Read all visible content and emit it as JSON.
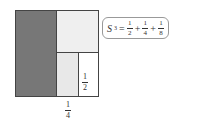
{
  "diagram": {
    "colors": {
      "dark": "#777777",
      "light": "#efefef",
      "border": "#444444"
    },
    "labels": {
      "inner_half": {
        "num": "1",
        "den": "2"
      },
      "bottom_quarter": {
        "num": "1",
        "den": "4"
      }
    },
    "formula": {
      "lhs": "S",
      "sub": "3",
      "eq": "=",
      "plus": "+",
      "terms": [
        {
          "num": "1",
          "den": "2"
        },
        {
          "num": "1",
          "den": "4"
        },
        {
          "num": "1",
          "den": "8"
        }
      ]
    }
  }
}
